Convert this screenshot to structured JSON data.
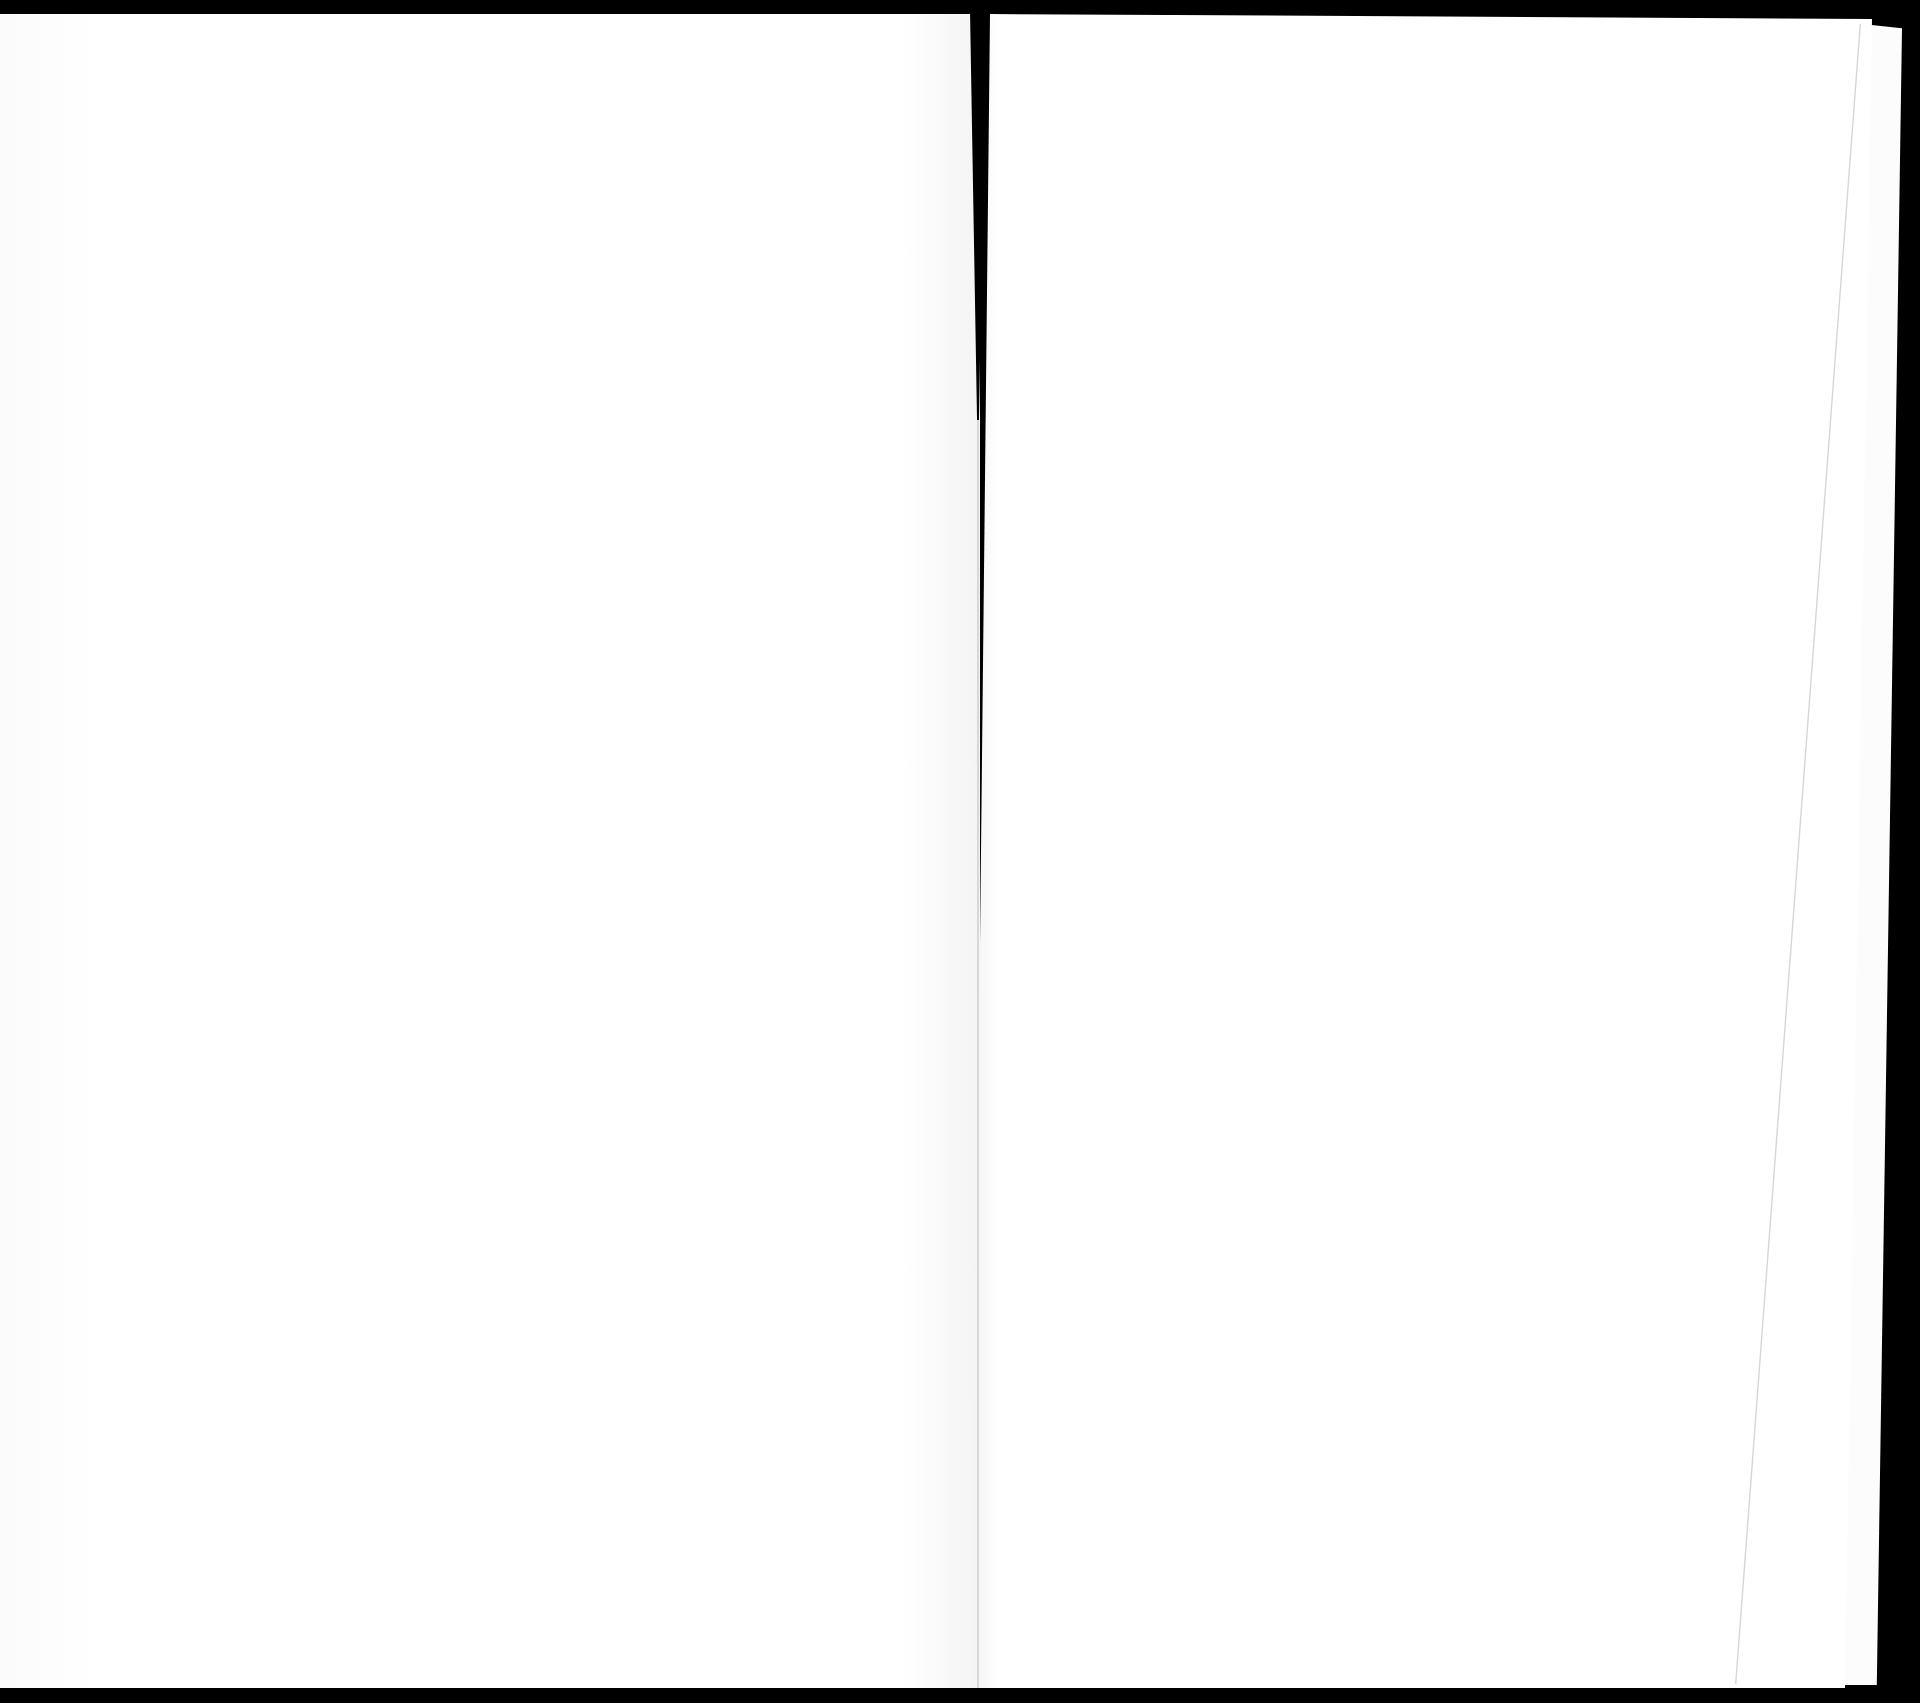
{
  "scan": {
    "description": "",
    "left_page": {
      "text": ""
    },
    "right_page": {
      "text": ""
    },
    "colors": {
      "background": "#000000",
      "paper": "#ffffff",
      "edge_shadow": "#d6d6d6"
    }
  }
}
